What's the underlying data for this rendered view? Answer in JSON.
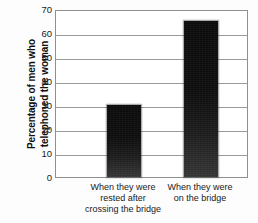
{
  "chart_data": {
    "type": "bar",
    "title": "",
    "subtitle": "",
    "xlabel": "",
    "ylabel": "Percentage of men who telephoned the woman",
    "ylabel_lines": [
      "Percentage of men who",
      "telephoned the woman"
    ],
    "categories": [
      "When they were rested after crossing the bridge",
      "When they were on the bridge"
    ],
    "category_lines": [
      [
        "When they were",
        "rested after",
        "crossing the bridge"
      ],
      [
        "When they were",
        "on the bridge"
      ]
    ],
    "values": [
      30,
      65
    ],
    "ylim": [
      0,
      70
    ],
    "ytick_step": 10,
    "yticks": [
      "70",
      "60",
      "50",
      "40",
      "30",
      "20",
      "10",
      "0"
    ],
    "ytick_values": [
      70,
      60,
      50,
      40,
      30,
      20,
      10,
      0
    ],
    "grid": true,
    "grid_orientation": "horizontal",
    "legend": false,
    "legend_position": "none",
    "bar_color": "#101010",
    "grid_color": "#9a9a9a",
    "axis_color": "#8f8f8f",
    "background_color": "#fdfdfd",
    "text_color": "#1a1a1a"
  }
}
